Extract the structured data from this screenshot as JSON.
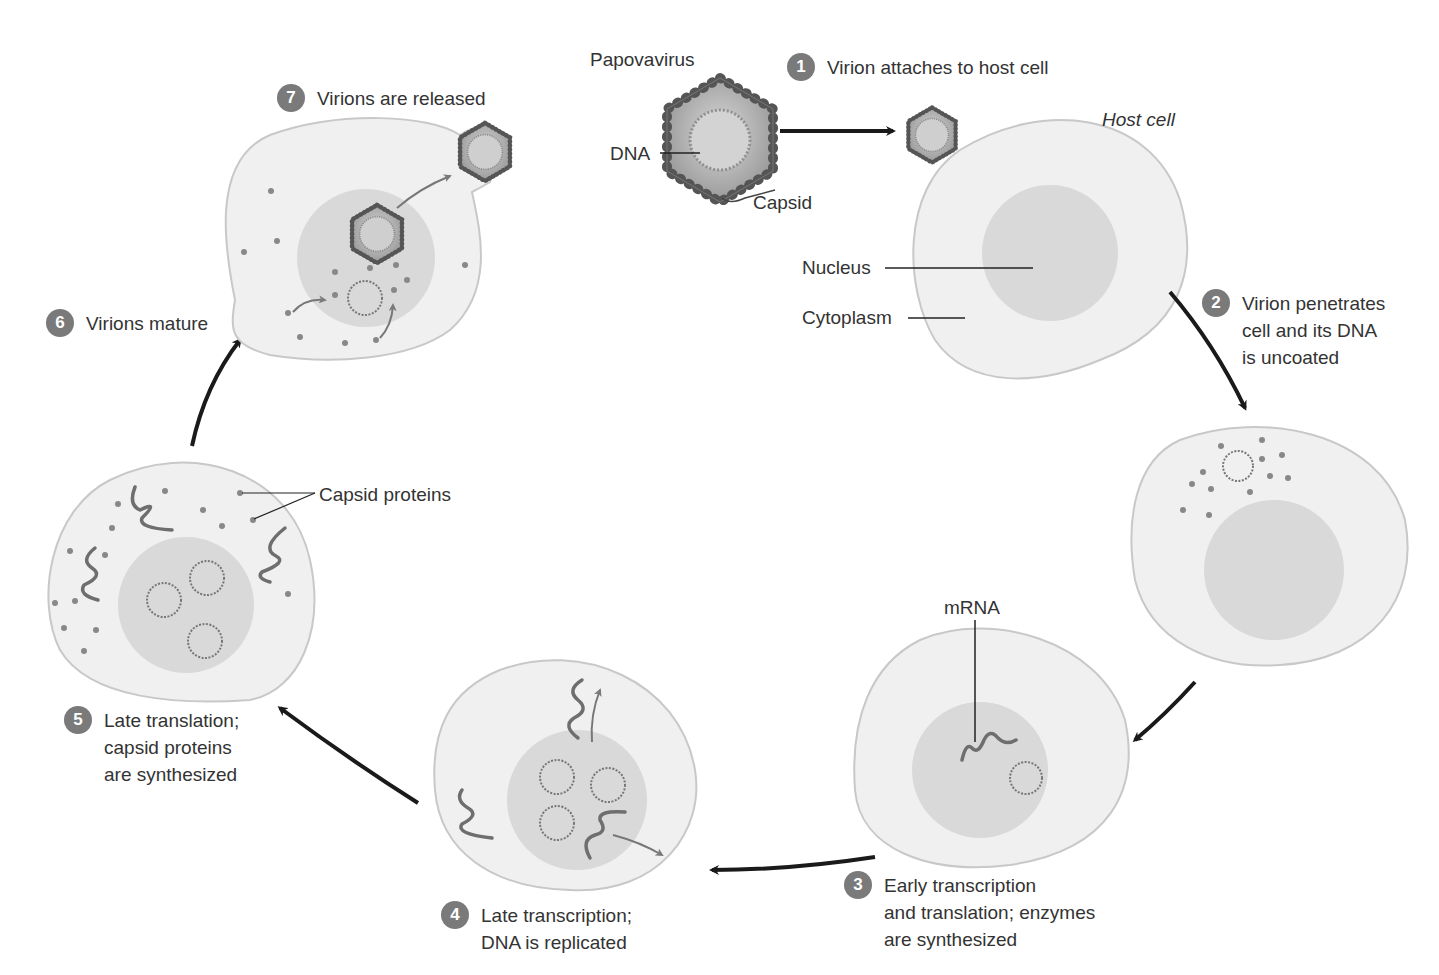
{
  "figure": {
    "virus_label": "Papovavirus",
    "dna_label": "DNA",
    "capsid_label": "Capsid",
    "host_cell_label": "Host cell",
    "nucleus_label": "Nucleus",
    "cytoplasm_label": "Cytoplasm",
    "mrna_label": "mRNA",
    "capsid_proteins_label": "Capsid proteins"
  },
  "steps": [
    {
      "number": "1",
      "text": "Virion attaches to host cell"
    },
    {
      "number": "2",
      "text": "Virion penetrates\ncell and its DNA\nis uncoated"
    },
    {
      "number": "3",
      "text": "Early transcription\nand translation; enzymes\nare synthesized"
    },
    {
      "number": "4",
      "text": "Late transcription;\nDNA is replicated"
    },
    {
      "number": "5",
      "text": "Late translation;\ncapsid proteins\nare synthesized"
    },
    {
      "number": "6",
      "text": "Virions mature"
    },
    {
      "number": "7",
      "text": "Virions are released"
    }
  ],
  "colors": {
    "cell_fill": "#f0f0f0",
    "cell_stroke": "#c8c8c8",
    "nucleus_fill": "#d9d9d9",
    "badge": "#7a7a7a",
    "arrow": "#1a1a1a",
    "dna": "#6e6e6e"
  }
}
